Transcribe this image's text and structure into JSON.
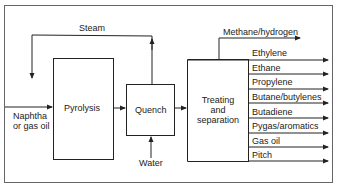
{
  "diagram": {
    "streams": {
      "steam": "Steam",
      "feed_line1": "Naphtha",
      "feed_line2": "or gas oil",
      "water": "Water",
      "methane": "Methane/hydrogen"
    },
    "units": {
      "pyrolysis": "Pyrolysis",
      "quench": "Quench",
      "treating_line1": "Treating",
      "treating_line2": "and",
      "treating_line3": "separation"
    },
    "products": [
      "Ethylene",
      "Ethane",
      "Propylene",
      "Butane/butylenes",
      "Butadiene",
      "Pygas/aromatics",
      "Gas oil",
      "Pitch"
    ],
    "colors": {
      "line": "#2a2a2a",
      "frame": "#555555",
      "background": "#ffffff"
    }
  }
}
